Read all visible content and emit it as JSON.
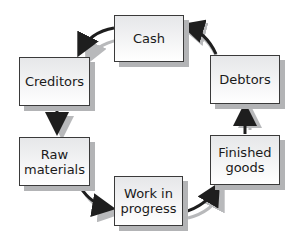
{
  "diagram": {
    "nodes": [
      {
        "id": "cash",
        "label": "Cash"
      },
      {
        "id": "debtors",
        "label": "Debtors"
      },
      {
        "id": "finished",
        "label": "Finished\ngoods"
      },
      {
        "id": "wip",
        "label": "Work in\nprogress"
      },
      {
        "id": "raw",
        "label": "Raw\nmaterials"
      },
      {
        "id": "creditors",
        "label": "Creditors"
      }
    ],
    "edges": [
      {
        "from": "cash",
        "to": "creditors"
      },
      {
        "from": "creditors",
        "to": "raw"
      },
      {
        "from": "raw",
        "to": "wip"
      },
      {
        "from": "wip",
        "to": "finished"
      },
      {
        "from": "finished",
        "to": "debtors"
      },
      {
        "from": "debtors",
        "to": "cash"
      }
    ],
    "colors": {
      "arrow": "#1e1e1e",
      "arrow_shadow": "#b8b9bb",
      "box_border": "#3a3a3a",
      "box_shadow": "#b3b4b6"
    }
  }
}
